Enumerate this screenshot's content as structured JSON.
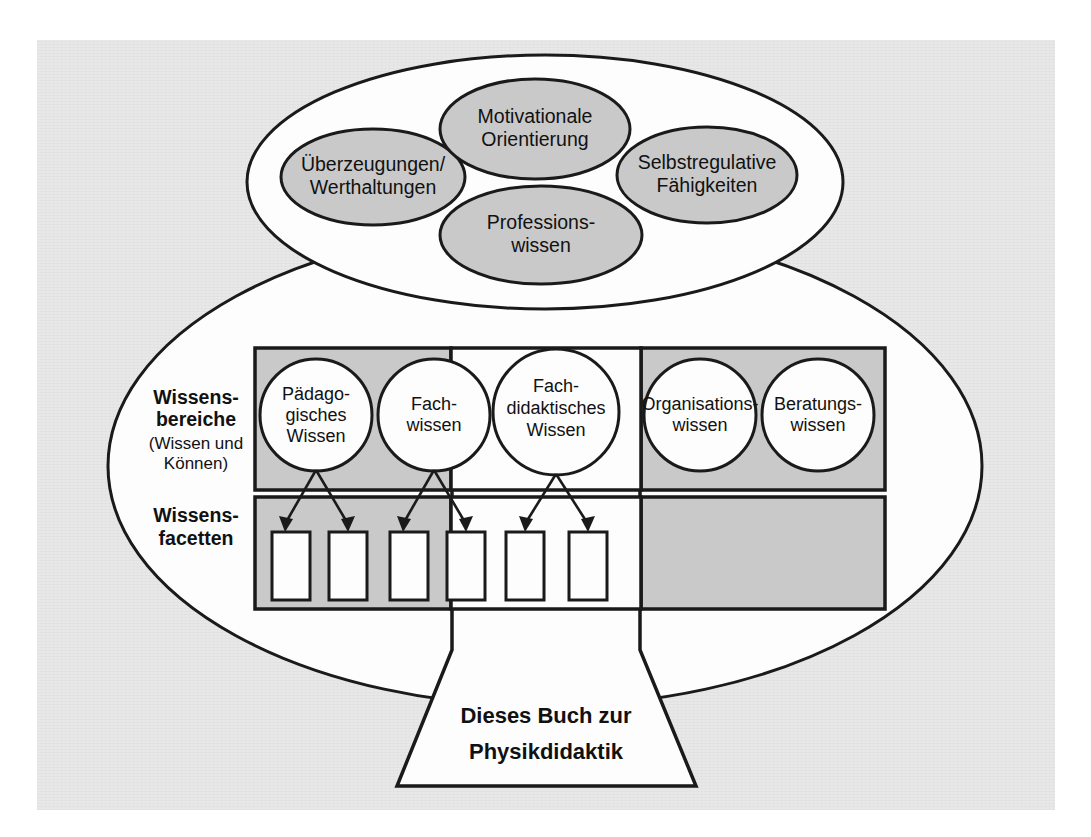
{
  "figure": {
    "language": "de",
    "title_text": "Dieses Buch zur Physikdidaktik",
    "background_color": "#e8e8e8",
    "ink_color": "#1a1a1a",
    "shape_fill_gray": "#c9c9c9",
    "shape_fill_white": "#fdfdfd"
  },
  "competence_cluster": {
    "outer_shape": "ellipse",
    "items": [
      {
        "id": "motivationale-orientierung",
        "line1": "Motivationale",
        "line2": "Orientierung",
        "fill": "#c9c9c9"
      },
      {
        "id": "ueberzeugungen-werthaltungen",
        "line1": "Überzeugungen/",
        "line2": "Werthaltungen",
        "fill": "#c9c9c9"
      },
      {
        "id": "selbstregulative-faehigkeiten",
        "line1": "Selbstregulative",
        "line2": "Fähigkeiten",
        "fill": "#c9c9c9"
      },
      {
        "id": "professionswissen",
        "line1": "Professions-",
        "line2": "wissen",
        "fill": "#c9c9c9"
      }
    ]
  },
  "side_labels": {
    "wissensbereiche": {
      "bold_line1": "Wissens-",
      "bold_line2": "bereiche",
      "note_line1": "(Wissen und",
      "note_line2": "Können)"
    },
    "wissensfacetten": {
      "bold_line1": "Wissens-",
      "bold_line2": "facetten"
    }
  },
  "knowledge_domains": {
    "row_label": "Wissensbereiche",
    "circles": [
      {
        "id": "paedagogisches-wissen",
        "line1": "Pädago-",
        "line2": "gisches",
        "line3": "Wissen",
        "band": "left"
      },
      {
        "id": "fachwissen",
        "line1": "Fach-",
        "line2": "wissen",
        "line3": "",
        "band": "left"
      },
      {
        "id": "fachdidaktisches-wissen",
        "line1": "Fach-",
        "line2": "didaktisches",
        "line3": "Wissen",
        "band": "center"
      },
      {
        "id": "organisationswissen",
        "line1": "Organisations-",
        "line2": "wissen",
        "line3": "",
        "band": "right"
      },
      {
        "id": "beratungswissen",
        "line1": "Beratungs-",
        "line2": "wissen",
        "line3": "",
        "band": "right"
      }
    ]
  },
  "knowledge_facets": {
    "row_label": "Wissensfacetten",
    "boxes": [
      {
        "id": "facet-1",
        "parent": "paedagogisches-wissen",
        "label": ""
      },
      {
        "id": "facet-2",
        "parent": "paedagogisches-wissen",
        "label": ""
      },
      {
        "id": "facet-3",
        "parent": "fachwissen",
        "label": ""
      },
      {
        "id": "facet-4",
        "parent": "fachwissen",
        "label": ""
      },
      {
        "id": "facet-5",
        "parent": "fachdidaktisches-wissen",
        "label": ""
      },
      {
        "id": "facet-6",
        "parent": "fachdidaktisches-wissen",
        "label": ""
      }
    ]
  },
  "book_base": {
    "line1": "Dieses Buch zur",
    "line2": "Physikdidaktik"
  }
}
